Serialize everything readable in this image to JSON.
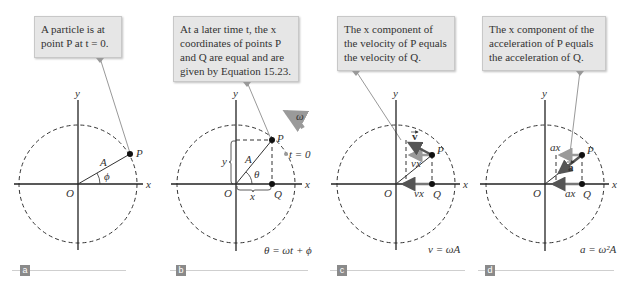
{
  "panels": [
    {
      "id": "a",
      "tag": "a",
      "callout": "A particle is at point P at t = 0.",
      "callout_lines": [
        "A particle is at",
        "point P at t = 0."
      ],
      "labels": {
        "x": "x",
        "y": "y",
        "origin": "O",
        "point_p": "P",
        "radius": "A",
        "angle": "ϕ"
      },
      "equation": ""
    },
    {
      "id": "b",
      "tag": "b",
      "callout": "At a later time t, the x coordinates of points P and Q are equal and are given by Equation 15.23.",
      "callout_lines": [
        "At a later time t, the x",
        "coordinates of points P",
        "and Q are equal and are",
        "given by Equation 15.23."
      ],
      "labels": {
        "x": "x",
        "y": "y",
        "origin": "O",
        "point_p": "P",
        "point_q": "Q",
        "radius": "A",
        "angle": "θ",
        "x_brace": "x",
        "y_brace": "y",
        "omega": "ω",
        "t0": "t = 0"
      },
      "equation": "θ = ωt + ϕ"
    },
    {
      "id": "c",
      "tag": "c",
      "callout": "The x component of the velocity of P equals the velocity of Q.",
      "callout_lines": [
        "The x component of",
        "the velocity of P equals",
        "the velocity of Q."
      ],
      "labels": {
        "x": "x",
        "y": "y",
        "origin": "O",
        "point_p": "P",
        "point_q": "Q",
        "vector": "v",
        "component_top": "vx",
        "component_bottom": "vx"
      },
      "equation": "v = ωA"
    },
    {
      "id": "d",
      "tag": "d",
      "callout": "The x component of the acceleration of P equals the acceleration of Q.",
      "callout_lines": [
        "The x component of the",
        "acceleration of P equals",
        "the acceleration of Q."
      ],
      "labels": {
        "x": "x",
        "y": "y",
        "origin": "O",
        "point_p": "P",
        "point_q": "Q",
        "vector": "a",
        "component_top": "ax",
        "component_bottom": "ax"
      },
      "equation": "a = ω²A"
    }
  ],
  "colors": {
    "callout_bg": "#e6e6e6",
    "arrow_gray": "#9a9a9a",
    "vector_dark": "#555555",
    "axis": "#222222",
    "tag_bg": "#8a8a8a"
  }
}
